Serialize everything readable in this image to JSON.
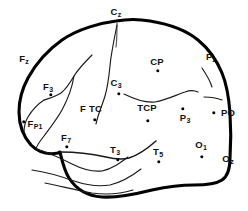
{
  "figure": {
    "type": "line-diagram",
    "width": 248,
    "height": 211,
    "background_color": "#ffffff",
    "outline_color": "#000000",
    "sulci_color": "#1a1a1a"
  },
  "electrodes": [
    {
      "id": "Cz",
      "base": "C",
      "sub": "z",
      "label_x": 116,
      "label_y": 12,
      "dot": false,
      "dot_x": 0,
      "dot_y": 0
    },
    {
      "id": "Fz",
      "base": "F",
      "sub": "z",
      "label_x": 24,
      "label_y": 59,
      "dot": false,
      "dot_x": 0,
      "dot_y": 0
    },
    {
      "id": "F3",
      "base": "F",
      "sub": "3",
      "label_x": 48,
      "label_y": 87,
      "dot": true,
      "dot_x": 51,
      "dot_y": 95
    },
    {
      "id": "FP1",
      "base": "F",
      "sub": "P1",
      "label_x": 35,
      "label_y": 124,
      "dot": true,
      "dot_x": 24,
      "dot_y": 122
    },
    {
      "id": "F7",
      "base": "F",
      "sub": "7",
      "label_x": 66,
      "label_y": 138,
      "dot": true,
      "dot_x": 67,
      "dot_y": 147
    },
    {
      "id": "FTC",
      "base": "F TC",
      "sub": "",
      "label_x": 91,
      "label_y": 109,
      "dot": true,
      "dot_x": 95,
      "dot_y": 120
    },
    {
      "id": "C3",
      "base": "C",
      "sub": "3",
      "label_x": 116,
      "label_y": 83,
      "dot": true,
      "dot_x": 119,
      "dot_y": 94
    },
    {
      "id": "T3",
      "base": "T",
      "sub": "3",
      "label_x": 115,
      "label_y": 150,
      "dot": true,
      "dot_x": 118,
      "dot_y": 160
    },
    {
      "id": "T5",
      "base": "T",
      "sub": "5",
      "label_x": 158,
      "label_y": 152,
      "dot": true,
      "dot_x": 159,
      "dot_y": 162
    },
    {
      "id": "TCP",
      "base": "TCP",
      "sub": "",
      "label_x": 147,
      "label_y": 108,
      "dot": true,
      "dot_x": 148,
      "dot_y": 121
    },
    {
      "id": "CP",
      "base": "CP",
      "sub": "",
      "label_x": 157,
      "label_y": 62,
      "dot": true,
      "dot_x": 158,
      "dot_y": 71
    },
    {
      "id": "P3",
      "base": "P",
      "sub": "3",
      "label_x": 185,
      "label_y": 118,
      "dot": true,
      "dot_x": 183,
      "dot_y": 109
    },
    {
      "id": "Pz",
      "base": "P",
      "sub": "z",
      "label_x": 211,
      "label_y": 57,
      "dot": false,
      "dot_x": 0,
      "dot_y": 0
    },
    {
      "id": "PO",
      "base": "PO",
      "sub": "",
      "label_x": 228,
      "label_y": 113,
      "dot": true,
      "dot_x": 214,
      "dot_y": 113
    },
    {
      "id": "O1",
      "base": "O",
      "sub": "1",
      "label_x": 201,
      "label_y": 145,
      "dot": true,
      "dot_x": 202,
      "dot_y": 157
    },
    {
      "id": "Oz",
      "base": "O",
      "sub": "z",
      "label_x": 228,
      "label_y": 159,
      "dot": false,
      "dot_x": 0,
      "dot_y": 0
    }
  ]
}
